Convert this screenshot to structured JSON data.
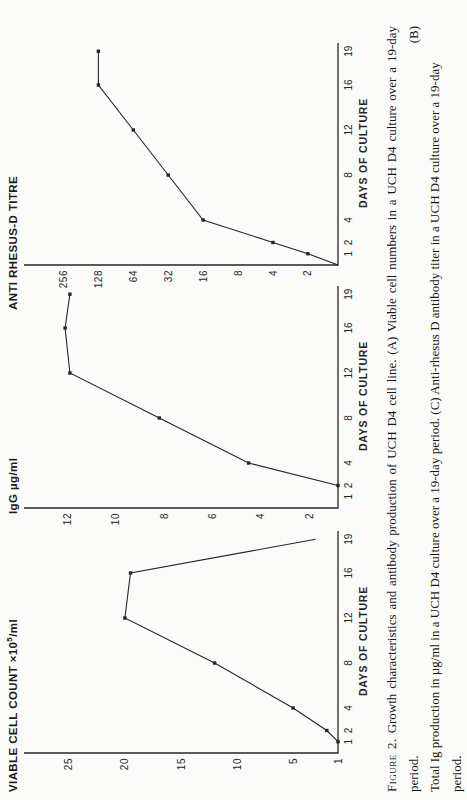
{
  "page": {
    "ink_color": "#262626",
    "paper_color": "#fbfbf9",
    "caption": {
      "label": "Figure 2.",
      "line1": "Growth characteristics and antibody production of UCH D4 cell line. (A) Viable cell numbers in a UCH D4 culture over a 19-day period. (B)",
      "line2": "Total Ig production in µg/ml in a UCH D4 culture over a 19-day period. (C) Anti-rhesus D antibody titer in a UCH D4 culture over a 19-day period."
    }
  },
  "chart_data": [
    {
      "id": "A",
      "type": "line",
      "title": "VIABLE CELL COUNT ×10⁵/ml",
      "title_pre": "VIABLE CELL COUNT  ×10",
      "title_sup": "5",
      "title_post": "/ml",
      "xlabel": "DAYS OF CULTURE",
      "x_ticks": [
        1,
        2,
        4,
        8,
        12,
        16,
        19
      ],
      "xlim": [
        0,
        20
      ],
      "y_ticks": [
        1,
        5,
        10,
        15,
        20,
        25
      ],
      "ylim": [
        1,
        29
      ],
      "y_scale": "linear",
      "grid": false,
      "x": [
        1,
        2,
        4,
        8,
        12,
        16,
        19
      ],
      "y": [
        1,
        2,
        5,
        12,
        20,
        19.5,
        3
      ],
      "start_at_origin": false,
      "last_point_marker": false
    },
    {
      "id": "B",
      "type": "line",
      "title": "IgG µg/ml",
      "title_pre": "IgG µg/ml",
      "title_sup": "",
      "title_post": "",
      "xlabel": "DAYS OF CULTURE",
      "x_ticks": [
        1,
        2,
        4,
        8,
        12,
        16,
        19
      ],
      "xlim": [
        0,
        20
      ],
      "y_ticks": [
        2,
        4,
        6,
        8,
        10,
        12
      ],
      "ylim": [
        0.8,
        13.8
      ],
      "y_scale": "linear",
      "grid": false,
      "x": [
        2,
        4,
        8,
        12,
        16,
        19
      ],
      "y": [
        0.8,
        4.5,
        8.2,
        11.9,
        12.1,
        11.9
      ],
      "start_at_origin": false,
      "last_point_marker": true
    },
    {
      "id": "C",
      "type": "line",
      "title": "ANTI RHESUS-D TITRE",
      "title_pre": "ANTI RHESUS-D TITRE",
      "title_sup": "",
      "title_post": "",
      "xlabel": "DAYS OF CULTURE",
      "x_ticks": [
        1,
        2,
        4,
        8,
        12,
        16,
        19
      ],
      "xlim": [
        0,
        20
      ],
      "y_ticks": [
        2,
        4,
        8,
        16,
        32,
        64,
        128,
        256
      ],
      "ylim": [
        1.1,
        560
      ],
      "y_scale": "log2",
      "grid": false,
      "x": [
        1,
        2,
        4,
        8,
        12,
        16,
        19
      ],
      "y": [
        2,
        4,
        16,
        32,
        64,
        128,
        128
      ],
      "start_at_origin": true,
      "last_point_marker": true
    }
  ]
}
